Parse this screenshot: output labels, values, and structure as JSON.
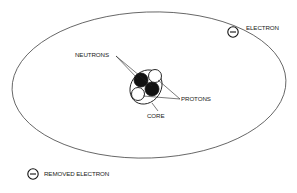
{
  "diagram": {
    "type": "atom-model",
    "labels": {
      "electron": "ELECTRON",
      "neutrons": "NEUTRONS",
      "protons": "PROTONS",
      "core": "CORE",
      "removed_electron": "REMOVED ELECTRON"
    },
    "electron_symbol": "−",
    "colors": {
      "line": "#333333",
      "neutron_fill": "#111111",
      "proton_fill": "#ffffff",
      "background": "#ffffff"
    },
    "nucleus": {
      "neutrons": 2,
      "protons": 2
    }
  }
}
